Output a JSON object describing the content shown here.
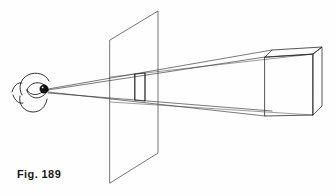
{
  "figure": {
    "caption": "Fig. 189",
    "background_color": "#fefefe",
    "ink_color": "#2b2b2b",
    "width": 336,
    "height": 196
  },
  "elements": {
    "eye": {
      "label": "eye",
      "station_point": {
        "x": 47,
        "y": 90
      }
    },
    "picture_plane": {
      "label": "picture plane",
      "corners": [
        {
          "x": 110,
          "y": 40
        },
        {
          "x": 158,
          "y": 11
        },
        {
          "x": 158,
          "y": 153
        },
        {
          "x": 110,
          "y": 183
        }
      ]
    },
    "projected_image": {
      "label": "projected image of box",
      "corners": [
        {
          "x": 135,
          "y": 74
        },
        {
          "x": 145,
          "y": 73
        },
        {
          "x": 145,
          "y": 101
        },
        {
          "x": 135,
          "y": 100
        }
      ]
    },
    "box": {
      "label": "box object",
      "front_face": [
        {
          "x": 265,
          "y": 57
        },
        {
          "x": 313,
          "y": 54
        },
        {
          "x": 313,
          "y": 115
        },
        {
          "x": 265,
          "y": 116
        }
      ],
      "back_top_left": {
        "x": 272,
        "y": 50
      },
      "back_top_right": {
        "x": 322,
        "y": 47
      },
      "back_bottom_right": {
        "x": 322,
        "y": 106
      }
    },
    "rays": {
      "label": "projection rays",
      "count": 4,
      "from": "eye",
      "to": "box corners"
    }
  }
}
